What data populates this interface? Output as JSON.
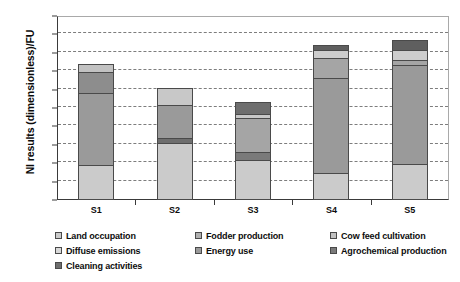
{
  "chart_data": {
    "type": "bar",
    "subtype": "stacked-bar",
    "title": "",
    "xlabel": "",
    "ylabel": "NI results (dimensionless)/FU",
    "categories": [
      "S1",
      "S2",
      "S3",
      "S4",
      "S5"
    ],
    "ylim": [
      0.0,
      0.1
    ],
    "ytick_labels": [
      "0.00",
      "0.01",
      "0.02",
      "0.03",
      "0.04",
      "0.05",
      "0.06",
      "0.07",
      "0.08",
      "0.09",
      "0.10"
    ],
    "ytick_values": [
      0.0,
      0.01,
      0.02,
      0.03,
      0.04,
      0.05,
      0.06,
      0.07,
      0.08,
      0.09,
      0.1
    ],
    "grid": true,
    "grid_style": "dashed-horizontal",
    "legend_position": "bottom",
    "series": [
      {
        "name": "Land occupation",
        "color": "#cbcbcb",
        "values": [
          0.019,
          0.031,
          0.0215,
          0.0145,
          0.0195
        ]
      },
      {
        "name": "Diffuse emissions",
        "color": "#d9d9d9",
        "values": [
          0.0,
          0.0,
          0.0,
          0.0,
          0.0
        ]
      },
      {
        "name": "Cleaning activities",
        "color": "#6e6e6e",
        "values": [
          0.0,
          0.0035,
          0.005,
          0.0,
          0.0
        ]
      },
      {
        "name": "Fodder production",
        "color": "#b0b0b0",
        "values": [
          0.0,
          0.0,
          0.0,
          0.0,
          0.0
        ]
      },
      {
        "name": "Energy use",
        "color": "#9a9a9a",
        "values": [
          0.0395,
          0.0185,
          0.019,
          0.0525,
          0.0545
        ]
      },
      {
        "name": "Cow feed cultivation",
        "color": "#c2c2c2",
        "values": [
          0.012,
          0.0,
          0.003,
          0.0,
          0.0
        ]
      },
      {
        "name": "Agrochemical production",
        "color": "#7a7a7a",
        "values": [
          0.005,
          0.0095,
          0.007,
          0.0195,
          0.0152
        ]
      }
    ],
    "bars": [
      {
        "category": "S1",
        "total": 0.0755,
        "segments": [
          {
            "label": "Land occupation",
            "value": 0.019,
            "from": 0.0,
            "to": 0.019,
            "color": "#cbcbcb"
          },
          {
            "label": "Energy use",
            "value": 0.0395,
            "from": 0.019,
            "to": 0.0585,
            "color": "#9a9a9a"
          },
          {
            "label": "Agrochemical production",
            "value": 0.012,
            "from": 0.0585,
            "to": 0.0705,
            "color": "#8d8d8d"
          },
          {
            "label": "Cow feed cultivation",
            "value": 0.005,
            "from": 0.0705,
            "to": 0.0755,
            "color": "#c2c2c2"
          }
        ]
      },
      {
        "category": "S2",
        "total": 0.0625,
        "segments": [
          {
            "label": "Land occupation",
            "value": 0.031,
            "from": 0.0,
            "to": 0.031,
            "color": "#cbcbcb"
          },
          {
            "label": "Cleaning activities",
            "value": 0.0035,
            "from": 0.031,
            "to": 0.0345,
            "color": "#6e6e6e"
          },
          {
            "label": "Energy use",
            "value": 0.0185,
            "from": 0.0345,
            "to": 0.053,
            "color": "#9a9a9a"
          },
          {
            "label": "Cow feed cultivation",
            "value": 0.0095,
            "from": 0.053,
            "to": 0.0625,
            "color": "#c8c8c8"
          }
        ]
      },
      {
        "category": "S3",
        "total": 0.0555,
        "segments": [
          {
            "label": "Land occupation",
            "value": 0.0215,
            "from": 0.0,
            "to": 0.0215,
            "color": "#cbcbcb"
          },
          {
            "label": "Cleaning activities",
            "value": 0.005,
            "from": 0.0215,
            "to": 0.0265,
            "color": "#7a7a7a"
          },
          {
            "label": "Energy use",
            "value": 0.019,
            "from": 0.0265,
            "to": 0.0455,
            "color": "#a5a5a5"
          },
          {
            "label": "Cow feed cultivation",
            "value": 0.003,
            "from": 0.0455,
            "to": 0.0485,
            "color": "#c8c8c8"
          },
          {
            "label": "Agrochemical production",
            "value": 0.007,
            "from": 0.0485,
            "to": 0.0555,
            "color": "#6e6e6e"
          }
        ]
      },
      {
        "category": "S4",
        "total": 0.0865,
        "segments": [
          {
            "label": "Land occupation",
            "value": 0.0145,
            "from": 0.0,
            "to": 0.0145,
            "color": "#cbcbcb"
          },
          {
            "label": "Energy use",
            "value": 0.0525,
            "from": 0.0145,
            "to": 0.067,
            "color": "#9a9a9a"
          },
          {
            "label": "Agrochemical production",
            "value": 0.0115,
            "from": 0.067,
            "to": 0.0785,
            "color": "#a5a5a5"
          },
          {
            "label": "Cow feed cultivation",
            "value": 0.0045,
            "from": 0.0785,
            "to": 0.083,
            "color": "#cdcdcd"
          },
          {
            "label": "Cleaning activities",
            "value": 0.0035,
            "from": 0.083,
            "to": 0.0865,
            "color": "#5f5f5f"
          }
        ]
      },
      {
        "category": "S5",
        "total": 0.0892,
        "segments": [
          {
            "label": "Land occupation",
            "value": 0.0195,
            "from": 0.0,
            "to": 0.0195,
            "color": "#cbcbcb"
          },
          {
            "label": "Energy use",
            "value": 0.0545,
            "from": 0.0195,
            "to": 0.074,
            "color": "#9a9a9a"
          },
          {
            "label": "Agrochemical production",
            "value": 0.0032,
            "from": 0.074,
            "to": 0.0772,
            "color": "#a5a5a5"
          },
          {
            "label": "Cow feed cultivation",
            "value": 0.006,
            "from": 0.0772,
            "to": 0.0832,
            "color": "#cdcdcd"
          },
          {
            "label": "Cleaning activities",
            "value": 0.006,
            "from": 0.0832,
            "to": 0.0892,
            "color": "#5f5f5f"
          }
        ]
      }
    ],
    "legend": [
      {
        "label": "Land occupation",
        "color": "#cbcbcb",
        "column": 0
      },
      {
        "label": "Diffuse emissions",
        "color": "#d9d9d9",
        "column": 0
      },
      {
        "label": "Cleaning activities",
        "color": "#6e6e6e",
        "column": 0
      },
      {
        "label": "Fodder production",
        "color": "#b0b0b0",
        "column": 1
      },
      {
        "label": "Energy use",
        "color": "#9a9a9a",
        "column": 1
      },
      {
        "label": "Cow feed cultivation",
        "color": "#c2c2c2",
        "column": 2
      },
      {
        "label": "Agrochemical production",
        "color": "#7a7a7a",
        "column": 2
      }
    ]
  }
}
